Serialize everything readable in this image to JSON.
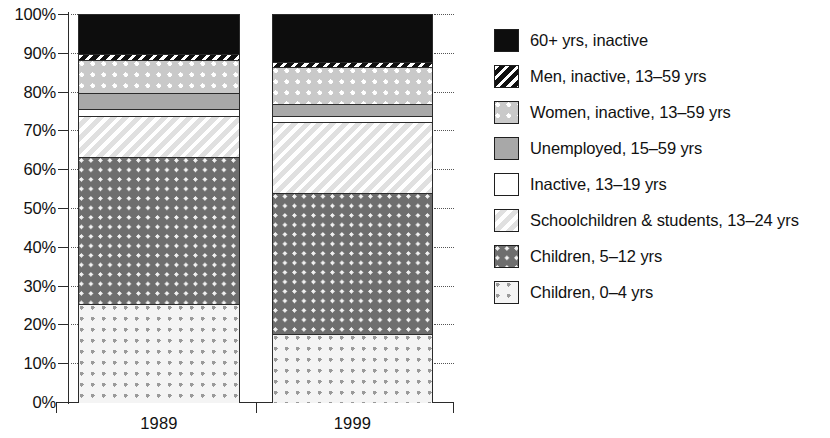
{
  "chart_data": {
    "type": "bar",
    "subtype": "stacked-percentage",
    "title": "",
    "xlabel": "",
    "ylabel": "",
    "categories": [
      "1989",
      "1999"
    ],
    "ylim": [
      0,
      100
    ],
    "y_tick_labels": [
      "0%",
      "10%",
      "20%",
      "30%",
      "40%",
      "50%",
      "60%",
      "70%",
      "80%",
      "90%",
      "100%"
    ],
    "y_tick_values": [
      0,
      10,
      20,
      30,
      40,
      50,
      60,
      70,
      80,
      90,
      100
    ],
    "grid": false,
    "legend_position": "right",
    "stack_order_bottom_to_top": [
      "Children, 0–4 yrs",
      "Children, 5–12 yrs",
      "Schoolchildren & students, 13–24 yrs",
      "Inactive, 13–19 yrs",
      "Unemployed, 15–59 yrs",
      "Women, inactive, 13–59 yrs",
      "Men, inactive, 13–59 yrs",
      "60+ yrs, inactive"
    ],
    "series": [
      {
        "name": "Children, 0–4 yrs",
        "pattern": "dot-sparse",
        "values": [
          25.5,
          17.8
        ],
        "cumulative_top": [
          25.5,
          17.8
        ]
      },
      {
        "name": "Children, 5–12 yrs",
        "pattern": "dot-dark",
        "values": [
          38.0,
          36.2
        ],
        "cumulative_top": [
          63.5,
          54.0
        ]
      },
      {
        "name": "Schoolchildren & students, 13–24 yrs",
        "pattern": "hatch-light",
        "values": [
          10.5,
          18.5
        ],
        "cumulative_top": [
          74.0,
          72.5
        ]
      },
      {
        "name": "Inactive, 13–19 yrs",
        "pattern": "white",
        "values": [
          1.8,
          1.5
        ],
        "cumulative_top": [
          75.8,
          74.0
        ]
      },
      {
        "name": "Unemployed, 15–59 yrs",
        "pattern": "solid-gray",
        "values": [
          4.0,
          3.0
        ],
        "cumulative_top": [
          79.8,
          77.0
        ]
      },
      {
        "name": "Women, inactive, 13–59 yrs",
        "pattern": "dot-light",
        "values": [
          8.7,
          9.5
        ],
        "cumulative_top": [
          88.5,
          86.5
        ]
      },
      {
        "name": "Men, inactive, 13–59 yrs",
        "pattern": "hatch-bold",
        "values": [
          1.5,
          1.5
        ],
        "cumulative_top": [
          90.0,
          88.0
        ]
      },
      {
        "name": "60+ yrs, inactive",
        "pattern": "solid-black",
        "values": [
          10.0,
          12.0
        ],
        "cumulative_top": [
          100.0,
          100.0
        ]
      }
    ]
  },
  "axis": {
    "y_ticks": [
      {
        "label": "100%",
        "value": 100
      },
      {
        "label": "90%",
        "value": 90
      },
      {
        "label": "80%",
        "value": 80
      },
      {
        "label": "70%",
        "value": 70
      },
      {
        "label": "60%",
        "value": 60
      },
      {
        "label": "50%",
        "value": 50
      },
      {
        "label": "40%",
        "value": 40
      },
      {
        "label": "30%",
        "value": 30
      },
      {
        "label": "20%",
        "value": 20
      },
      {
        "label": "10%",
        "value": 10
      },
      {
        "label": "0%",
        "value": 0
      }
    ],
    "x_labels": [
      "1989",
      "1999"
    ]
  },
  "legend": {
    "items": [
      {
        "label": "60+ yrs, inactive",
        "pattern": "solid-black"
      },
      {
        "label": "Men, inactive, 13–59 yrs",
        "pattern": "hatch-bold"
      },
      {
        "label": "Women, inactive, 13–59 yrs",
        "pattern": "dot-light"
      },
      {
        "label": "Unemployed, 15–59 yrs",
        "pattern": "solid-gray"
      },
      {
        "label": "Inactive, 13–19 yrs",
        "pattern": "white"
      },
      {
        "label": "Schoolchildren & students, 13–24 yrs",
        "pattern": "hatch-light"
      },
      {
        "label": "Children, 5–12 yrs",
        "pattern": "dot-dark"
      },
      {
        "label": "Children, 0–4 yrs",
        "pattern": "dot-sparse"
      }
    ]
  },
  "colors": {
    "axis": "#2b2b2b",
    "text": "#111111",
    "background": "#ffffff"
  }
}
